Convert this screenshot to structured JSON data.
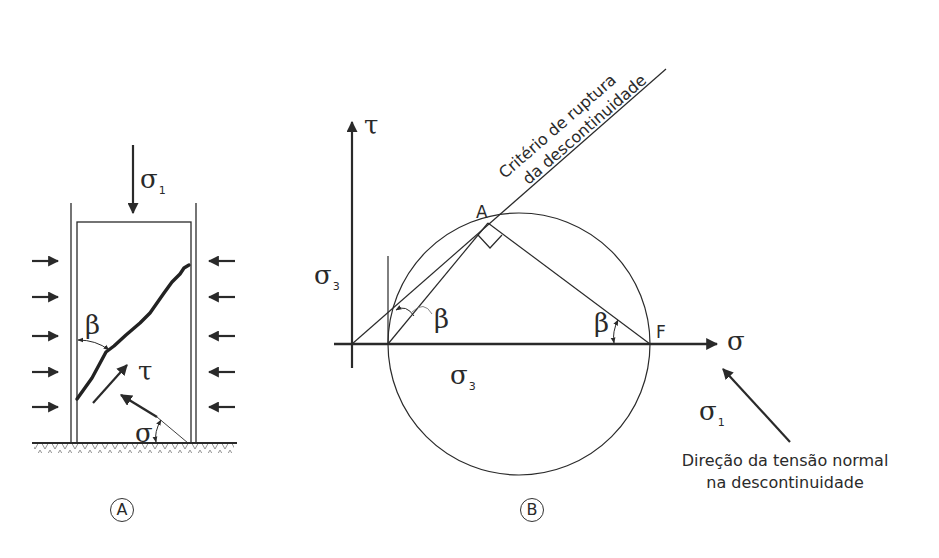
{
  "figure_a": {
    "panel_label": "A",
    "sigma1_label": "σ",
    "sigma1_sub": "1",
    "beta_label": "β",
    "tau_label": "τ",
    "sigma_label": "σ",
    "lateral_arrows_count": 5
  },
  "figure_b": {
    "panel_label": "B",
    "tau_axis_label": "τ",
    "sigma_axis_label": "σ",
    "sigma3_left_label": "σ",
    "sigma3_left_sub": "3",
    "sigma3_bottom_label": "σ",
    "sigma3_bottom_sub": "3",
    "point_a_label": "A",
    "point_f_label": "F",
    "beta_left_label": "β",
    "beta_right_label": "β",
    "sigma1_label": "σ",
    "sigma1_sub": "1",
    "failure_criterion_line1": "Critério de ruptura",
    "failure_criterion_line2": "da descontinuidade",
    "normal_direction_line1": "Direção da tensão normal",
    "normal_direction_line2": "na descontinuidade"
  },
  "colors": {
    "stroke": "#2a2a2a",
    "background": "#ffffff"
  }
}
